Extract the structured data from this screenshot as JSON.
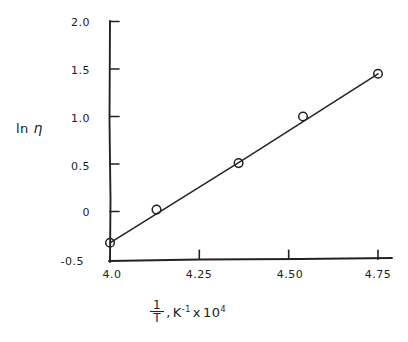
{
  "chart_data": {
    "type": "scatter",
    "title": "",
    "subtitle": "",
    "xlabel": "1/T, K^-1 x 10^4",
    "ylabel": "ln n",
    "xlabel_parts": {
      "frac_numerator": "1",
      "frac_denominator": "T",
      "separator": ",",
      "unit_base": "K",
      "unit_exponent": "-1",
      "times": "x",
      "scale_base": "10",
      "scale_exponent": "4"
    },
    "ylabel_parts": {
      "ln": "ln",
      "symbol": "η"
    },
    "xlim": [
      4.0,
      4.78
    ],
    "ylim": [
      -0.5,
      2.0
    ],
    "xticks": [
      4.0,
      4.25,
      4.5,
      4.75
    ],
    "xtick_labels": [
      "4.0",
      "4.25",
      "4.50",
      "4.75"
    ],
    "yticks": [
      -0.5,
      0,
      0.5,
      1.0,
      1.5,
      2.0
    ],
    "ytick_labels": [
      "-0.5",
      "0",
      "0.5",
      "1.0",
      "1.5",
      "2.0"
    ],
    "grid": false,
    "legend": null,
    "marker_style": "open-circle",
    "line_style": "solid-fit-line",
    "x": [
      4.0,
      4.13,
      4.36,
      4.54,
      4.75
    ],
    "y": [
      -0.33,
      0.02,
      0.51,
      1.0,
      1.45
    ],
    "points": [
      {
        "x": 4.0,
        "y": -0.33
      },
      {
        "x": 4.13,
        "y": 0.02
      },
      {
        "x": 4.36,
        "y": 0.51
      },
      {
        "x": 4.54,
        "y": 1.0
      },
      {
        "x": 4.75,
        "y": 1.45
      }
    ],
    "fit_line": {
      "x_start": 4.0,
      "y_start": -0.33,
      "x_end": 4.75,
      "y_end": 1.45,
      "slope": 2.4
    }
  },
  "colors": {
    "ink": "#222222",
    "background": "#ffffff"
  }
}
